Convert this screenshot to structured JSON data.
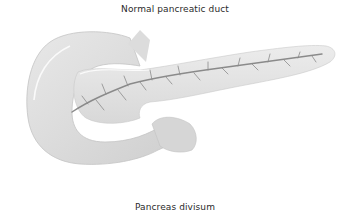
{
  "diagram": {
    "top_label": "Normal pancreatic duct",
    "bottom_label": "Pancreas divisum",
    "colors": {
      "background": "#ffffff",
      "organ_fill": "#e2e2e2",
      "organ_shade": "#c8c8c8",
      "duct": "#8a8a8a",
      "highlight": "#f8f8f8",
      "text": "#2a2a2a"
    }
  }
}
